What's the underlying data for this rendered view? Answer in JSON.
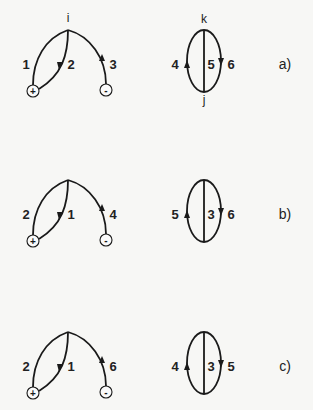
{
  "figure": {
    "panels": [
      {
        "id": "a",
        "label": "a)",
        "offset_y": 0,
        "tree": {
          "apex_label": "i",
          "left_edge": "1",
          "middle_edge": "2",
          "right_edge": "3",
          "plus_terminal": "+",
          "minus_terminal": "-"
        },
        "loop": {
          "top_label": "k",
          "bottom_label": "j",
          "left_edge": "4",
          "center_edge": "5",
          "right_edge": "6"
        }
      },
      {
        "id": "b",
        "label": "b)",
        "offset_y": 150,
        "tree": {
          "apex_label": "",
          "left_edge": "2",
          "middle_edge": "1",
          "right_edge": "4",
          "plus_terminal": "+",
          "minus_terminal": "-"
        },
        "loop": {
          "top_label": "",
          "bottom_label": "",
          "left_edge": "5",
          "center_edge": "3",
          "right_edge": "6"
        }
      },
      {
        "id": "c",
        "label": "c)",
        "offset_y": 302,
        "tree": {
          "apex_label": "",
          "left_edge": "2",
          "middle_edge": "1",
          "right_edge": "6",
          "plus_terminal": "+",
          "minus_terminal": "-"
        },
        "loop": {
          "top_label": "",
          "bottom_label": "",
          "left_edge": "4",
          "center_edge": "3",
          "right_edge": "5"
        }
      }
    ]
  }
}
